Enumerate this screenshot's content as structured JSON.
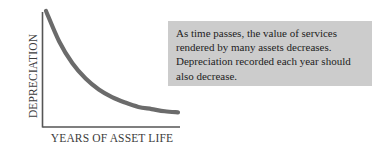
{
  "chart_data": {
    "type": "line",
    "title": "",
    "xlabel": "YEARS OF ASSET LIFE",
    "ylabel": "DEPRECIATION",
    "x": [
      0,
      1,
      2,
      3,
      4,
      5,
      6,
      7,
      8,
      9,
      10
    ],
    "series": [
      {
        "name": "Depreciation expense",
        "values": [
          100,
          72,
          52,
          38,
          28,
          21,
          16,
          12,
          10,
          8,
          7
        ]
      }
    ],
    "xlim": [
      0,
      10
    ],
    "ylim": [
      0,
      100
    ],
    "grid": false,
    "legend": false,
    "axis_ticks": false,
    "curve_color": "#6b6b6b",
    "axis_color": "#555555",
    "annotations": [
      "As time passes, the value of services rendered by many assets decreases. Depreciation recorded each year should also decrease."
    ]
  },
  "figure": {
    "y_axis_label": "DEPRECIATION",
    "x_axis_label": "YEARS OF ASSET LIFE"
  },
  "callout": {
    "background_color": "#cccccc",
    "text_color": "#1d1d1d",
    "lines": [
      "As time passes, the value of services",
      "rendered by many assets decreases.",
      "Depreciation recorded each year should",
      "also decrease."
    ]
  }
}
